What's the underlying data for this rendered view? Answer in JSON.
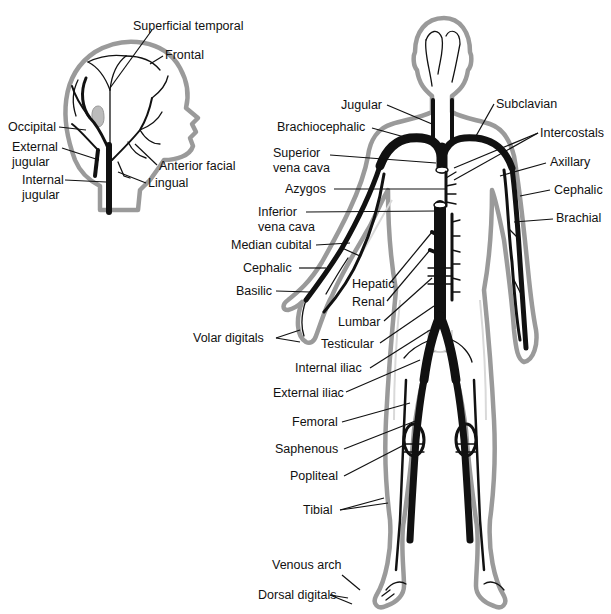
{
  "diagram": {
    "head_inset": {
      "labels": [
        {
          "id": "superficial-temporal",
          "text": "Superficial temporal",
          "x": 133,
          "y": 30
        },
        {
          "id": "frontal",
          "text": "Frontal",
          "x": 165,
          "y": 59
        },
        {
          "id": "occipital",
          "text": "Occipital",
          "x": 8,
          "y": 131
        },
        {
          "id": "external-jugular-1",
          "text": "External",
          "x": 12,
          "y": 151
        },
        {
          "id": "external-jugular-2",
          "text": "jugular",
          "x": 12,
          "y": 166
        },
        {
          "id": "internal-jugular-1",
          "text": "Internal",
          "x": 22,
          "y": 184
        },
        {
          "id": "internal-jugular-2",
          "text": "jugular",
          "x": 22,
          "y": 199
        },
        {
          "id": "anterior-facial",
          "text": "Anterior facial",
          "x": 159,
          "y": 170
        },
        {
          "id": "lingual",
          "text": "Lingual",
          "x": 148,
          "y": 187
        }
      ]
    },
    "body_labels_left": [
      {
        "id": "jugular",
        "text": "Jugular",
        "x": 341,
        "y": 109
      },
      {
        "id": "brachiocephalic",
        "text": "Brachiocephalic",
        "x": 277,
        "y": 131
      },
      {
        "id": "superior-vena-cava-1",
        "text": "Superior",
        "x": 273,
        "y": 157
      },
      {
        "id": "superior-vena-cava-2",
        "text": "vena cava",
        "x": 273,
        "y": 172
      },
      {
        "id": "azygos",
        "text": "Azygos",
        "x": 285,
        "y": 193
      },
      {
        "id": "inferior-vena-cava-1",
        "text": "Inferior",
        "x": 258,
        "y": 216
      },
      {
        "id": "inferior-vena-cava-2",
        "text": "vena cava",
        "x": 258,
        "y": 231
      },
      {
        "id": "median-cubital",
        "text": "Median cubital",
        "x": 231,
        "y": 249
      },
      {
        "id": "cephalic-forearm",
        "text": "Cephalic",
        "x": 243,
        "y": 272
      },
      {
        "id": "basilic",
        "text": "Basilic",
        "x": 236,
        "y": 295
      },
      {
        "id": "volar-digitals",
        "text": "Volar digitals",
        "x": 193,
        "y": 342
      },
      {
        "id": "hepatic",
        "text": "Hepatic",
        "x": 352,
        "y": 288
      },
      {
        "id": "renal",
        "text": "Renal",
        "x": 352,
        "y": 306
      },
      {
        "id": "lumbar",
        "text": "Lumbar",
        "x": 338,
        "y": 326
      },
      {
        "id": "testicular",
        "text": "Testicular",
        "x": 321,
        "y": 348
      },
      {
        "id": "internal-iliac",
        "text": "Internal iliac",
        "x": 295,
        "y": 372
      },
      {
        "id": "external-iliac",
        "text": "External iliac",
        "x": 273,
        "y": 397
      },
      {
        "id": "femoral",
        "text": "Femoral",
        "x": 292,
        "y": 426
      },
      {
        "id": "saphenous",
        "text": "Saphenous",
        "x": 275,
        "y": 453
      },
      {
        "id": "popliteal",
        "text": "Popliteal",
        "x": 290,
        "y": 480
      },
      {
        "id": "tibial",
        "text": "Tibial",
        "x": 303,
        "y": 514
      },
      {
        "id": "venous-arch",
        "text": "Venous arch",
        "x": 272,
        "y": 569
      },
      {
        "id": "dorsal-digitals",
        "text": "Dorsal digitals",
        "x": 258,
        "y": 599
      }
    ],
    "body_labels_right": [
      {
        "id": "subclavian",
        "text": "Subclavian",
        "x": 496,
        "y": 108
      },
      {
        "id": "intercostals",
        "text": "Intercostals",
        "x": 540,
        "y": 137
      },
      {
        "id": "axillary",
        "text": "Axillary",
        "x": 550,
        "y": 166
      },
      {
        "id": "cephalic-arm",
        "text": "Cephalic",
        "x": 554,
        "y": 194
      },
      {
        "id": "brachial",
        "text": "Brachial",
        "x": 556,
        "y": 222
      }
    ],
    "colors": {
      "vein": "#111111",
      "skin_outline": "#9a9a9a",
      "background": "#ffffff",
      "label_text": "#111111"
    }
  }
}
